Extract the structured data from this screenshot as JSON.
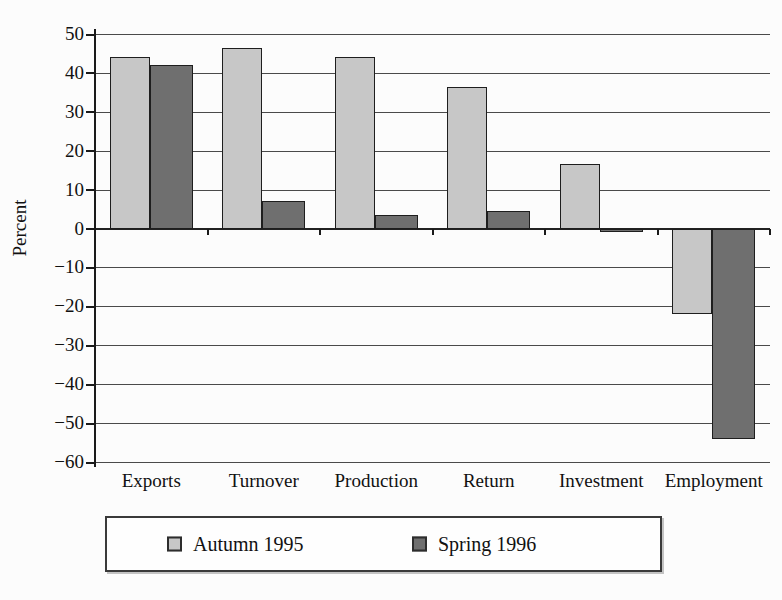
{
  "chart_data": {
    "type": "bar",
    "title": "",
    "xlabel": "",
    "ylabel": "Percent",
    "categories": [
      "Exports",
      "Turnover",
      "Production",
      "Return",
      "Investment",
      "Employment"
    ],
    "series": [
      {
        "name": "Autumn 1995",
        "color": "#c7c7c7",
        "values": [
          44,
          46.5,
          44,
          36.5,
          16.5,
          -22
        ]
      },
      {
        "name": "Spring 1996",
        "color": "#6f6f6f",
        "values": [
          42,
          7,
          3.5,
          4.5,
          -1,
          -54
        ]
      }
    ],
    "ylim": [
      -60,
      50
    ],
    "ytick_step": 10,
    "yticks": [
      50,
      40,
      30,
      20,
      10,
      0,
      -10,
      -20,
      -30,
      -40,
      -50,
      -60
    ],
    "grid": true,
    "legend_position": "bottom"
  },
  "style": {
    "background": "#fcfcfc",
    "bar_border": "#1e1e1e",
    "grid_color": "#4a4a4a",
    "axis_color": "#1a1a1a",
    "text_color": "#111111",
    "legend_border": "#3a3a3a",
    "legend_background": "#fefefe"
  }
}
